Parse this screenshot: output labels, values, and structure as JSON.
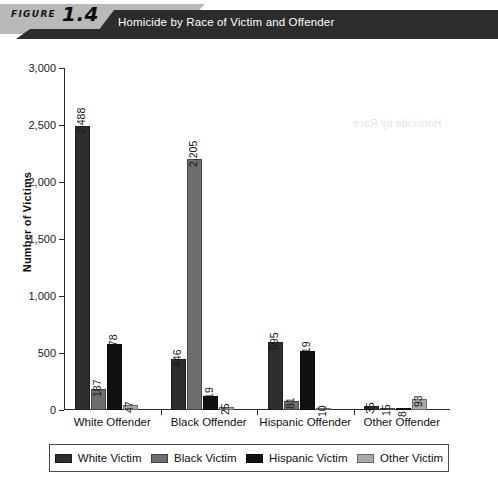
{
  "header": {
    "figure_word": "FIGURE",
    "figure_number": "1.4",
    "title": "Homicide by Race of Victim and Offender",
    "banner_gray": "#b9b9b9",
    "banner_dark": "#2c2c2c",
    "title_color": "#ffffff"
  },
  "chart_data": {
    "type": "bar",
    "title": "Homicide by Race of Victim and Offender",
    "xlabel": "",
    "ylabel": "Number of Victims",
    "ylim": [
      0,
      3000
    ],
    "ytick_step": 500,
    "ytick_labels": [
      "3,000",
      "2,500",
      "2,000",
      "1,500",
      "1,000",
      "500",
      "0"
    ],
    "ytick_values": [
      3000,
      2500,
      2000,
      1500,
      1000,
      500,
      0
    ],
    "grid": false,
    "legend_position": "bottom",
    "categories": [
      "White Offender",
      "Black Offender",
      "Hispanic Offender",
      "Other Offender"
    ],
    "series": [
      {
        "name": "White Victim",
        "color": "#2e2e2e",
        "values": [
          2488,
          446,
          595,
          35
        ],
        "labels": [
          "2,488",
          "446",
          "595",
          "35"
        ]
      },
      {
        "name": "Black Victim",
        "color": "#6e6e6e",
        "values": [
          187,
          2205,
          81,
          15
        ],
        "labels": [
          "187",
          "2,205",
          "81",
          "15"
        ]
      },
      {
        "name": "Hispanic Victim",
        "color": "#111111",
        "values": [
          578,
          119,
          519,
          8
        ],
        "labels": [
          "578",
          "119",
          "519",
          "8"
        ]
      },
      {
        "name": "Other Victim",
        "color": "#a8a8a8",
        "values": [
          47,
          25,
          10,
          93
        ],
        "labels": [
          "47",
          "25",
          "10",
          "93"
        ]
      }
    ]
  },
  "artifact": {
    "bleed_text": "Homicide by Race"
  }
}
